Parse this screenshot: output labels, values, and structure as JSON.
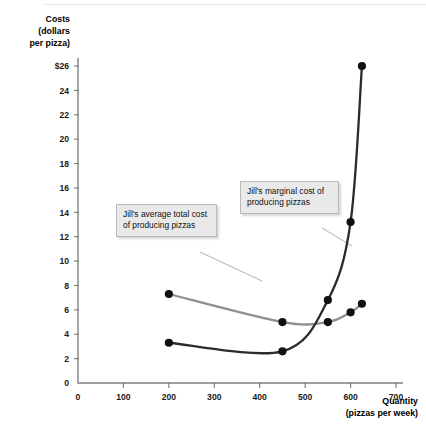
{
  "chart_data": {
    "type": "line",
    "title": "",
    "subtitle": "",
    "xlabel": "Quantity",
    "xlabel_units": "(pizzas per week)",
    "ylabel": "Costs",
    "ylabel_units_line1": "(dollars",
    "ylabel_units_line2": "per pizza)",
    "xlim": [
      0,
      700
    ],
    "ylim": [
      0,
      26
    ],
    "xticks": [
      0,
      100,
      200,
      300,
      400,
      500,
      600,
      700
    ],
    "xticklabels": [
      "0",
      "100",
      "200",
      "300",
      "400",
      "500",
      "600",
      "700"
    ],
    "yticks": [
      0,
      2,
      4,
      6,
      8,
      10,
      12,
      14,
      16,
      18,
      20,
      22,
      24,
      26
    ],
    "yticklabels": [
      "0",
      "2",
      "4",
      "6",
      "8",
      "10",
      "12",
      "14",
      "16",
      "18",
      "20",
      "22",
      "24",
      "$26"
    ],
    "grid": false,
    "legend": "none",
    "series": [
      {
        "name": "Jill's average total cost of producing pizzas",
        "key": "atc",
        "color": "#8f8f8f",
        "x": [
          200,
          450,
          550,
          600,
          625
        ],
        "values": [
          7.3,
          5.0,
          5.0,
          5.8,
          6.5
        ]
      },
      {
        "name": "Jill's marginal cost of producing pizzas",
        "key": "mc",
        "color": "#2b2b2b",
        "x": [
          200,
          450,
          550,
          600,
          625
        ],
        "values": [
          3.3,
          2.6,
          6.8,
          13.2,
          26.0
        ]
      }
    ],
    "annotations": [
      {
        "id": "callout-atc",
        "text": "Jill's average total cost of producing pizzas",
        "target_series": "atc"
      },
      {
        "id": "callout-mc",
        "text": "Jill's marginal cost of producing pizzas",
        "target_series": "mc"
      }
    ]
  }
}
